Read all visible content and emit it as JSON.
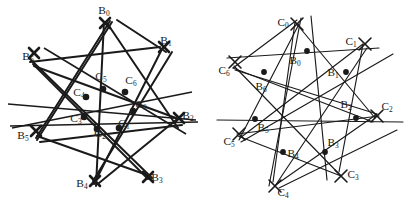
{
  "figure": {
    "kind": "geometry-configuration-pair",
    "stroke_color": "#1a1a1a",
    "label_color": "#181818",
    "background": "#ffffff",
    "panels": [
      {
        "id": "left",
        "line_width": 2.0,
        "point_marker": "heavy-cross",
        "b_labels": [
          {
            "text": "B",
            "sub": "0",
            "x": 104,
            "y": 14
          },
          {
            "text": "B",
            "sub": "1",
            "x": 166,
            "y": 44
          },
          {
            "text": "B",
            "sub": "2",
            "x": 188,
            "y": 119
          },
          {
            "text": "B",
            "sub": "3",
            "x": 157,
            "y": 181
          },
          {
            "text": "B",
            "sub": "4",
            "x": 82,
            "y": 187
          },
          {
            "text": "B",
            "sub": "5",
            "x": 23,
            "y": 139
          },
          {
            "text": "B",
            "sub": "6",
            "x": 28,
            "y": 60
          }
        ],
        "c_labels": [
          {
            "text": "C",
            "sub": "0",
            "x": 141,
            "y": 108
          },
          {
            "text": "C",
            "sub": "1",
            "x": 124,
            "y": 127
          },
          {
            "text": "C",
            "sub": "2",
            "x": 100,
            "y": 137
          },
          {
            "text": "C",
            "sub": "3",
            "x": 76,
            "y": 122
          },
          {
            "text": "C",
            "sub": "4",
            "x": 79,
            "y": 96
          },
          {
            "text": "C",
            "sub": "5",
            "x": 101,
            "y": 80
          },
          {
            "text": "C",
            "sub": "6",
            "x": 131,
            "y": 84
          }
        ]
      },
      {
        "id": "right",
        "line_width": 1.1,
        "point_marker": "light-cross",
        "b_labels": [
          {
            "text": "B",
            "sub": "0",
            "x": 88,
            "y": 64
          },
          {
            "text": "B",
            "sub": "1",
            "x": 124,
            "y": 76
          },
          {
            "text": "B",
            "sub": "2",
            "x": 137,
            "y": 110
          },
          {
            "text": "B",
            "sub": "3",
            "x": 124,
            "y": 148
          },
          {
            "text": "B",
            "sub": "4",
            "x": 84,
            "y": 157
          },
          {
            "text": "B",
            "sub": "5",
            "x": 55,
            "y": 130
          },
          {
            "text": "B",
            "sub": "6",
            "x": 54,
            "y": 90
          }
        ],
        "c_labels": [
          {
            "text": "C",
            "sub": "0",
            "x": 76,
            "y": 26
          },
          {
            "text": "C",
            "sub": "1",
            "x": 144,
            "y": 45
          },
          {
            "text": "C",
            "sub": "2",
            "x": 178,
            "y": 110
          },
          {
            "text": "C",
            "sub": "3",
            "x": 144,
            "y": 178
          },
          {
            "text": "C",
            "sub": "4",
            "x": 76,
            "y": 194
          },
          {
            "text": "C",
            "sub": "5",
            "x": 22,
            "y": 143
          },
          {
            "text": "C",
            "sub": "6",
            "x": 17,
            "y": 74
          }
        ]
      }
    ]
  }
}
